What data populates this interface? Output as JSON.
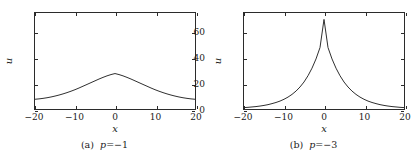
{
  "figure": {
    "background_color": "#ffffff",
    "line_color": "#2b2b2b",
    "axis_color": "#2b2b2b"
  },
  "chart_data": [
    {
      "type": "line",
      "panel_label": "(a)",
      "caption_prefix": "(a)",
      "caption_variable": "p",
      "caption_relation": "=",
      "caption_value": "−1",
      "caption_full": "(a) p = −1",
      "title": "",
      "xlabel": "x",
      "ylabel": "u",
      "xlim": [
        -20,
        20
      ],
      "ylim": [
        0,
        75
      ],
      "xticks": [
        -20,
        -10,
        0,
        10,
        20
      ],
      "xticklabels": [
        "−20",
        "−10",
        "0",
        "10",
        "20"
      ],
      "yticks": [
        0,
        20,
        40,
        60
      ],
      "yticklabels": [
        "0",
        "20",
        "40",
        "60"
      ],
      "grid": false,
      "legend": null,
      "peak_value": 28,
      "edge_value": 7.6,
      "x": [
        -20,
        -19,
        -18,
        -17,
        -16,
        -15,
        -14,
        -13,
        -12,
        -11,
        -10,
        -9,
        -8,
        -7,
        -6,
        -5,
        -4,
        -3,
        -2,
        -1,
        0,
        1,
        2,
        3,
        4,
        5,
        6,
        7,
        8,
        9,
        10,
        11,
        12,
        13,
        14,
        15,
        16,
        17,
        18,
        19,
        20
      ],
      "values": [
        7.6,
        7.9,
        8.3,
        8.8,
        9.4,
        10.1,
        10.9,
        11.8,
        12.8,
        13.9,
        15.1,
        16.4,
        17.8,
        19.2,
        20.6,
        22.0,
        23.4,
        24.7,
        25.9,
        26.9,
        27.7,
        26.9,
        25.9,
        24.7,
        23.4,
        22.0,
        20.6,
        19.2,
        17.8,
        16.4,
        15.1,
        13.9,
        12.8,
        11.8,
        10.9,
        10.1,
        9.4,
        8.8,
        8.3,
        7.9,
        7.6
      ]
    },
    {
      "type": "line",
      "panel_label": "(b)",
      "caption_prefix": "(b)",
      "caption_variable": "p",
      "caption_relation": "=",
      "caption_value": "−3",
      "caption_full": "(b) p = −3",
      "title": "",
      "xlabel": "x",
      "ylabel": "u",
      "xlim": [
        -20,
        20
      ],
      "ylim": [
        0,
        75
      ],
      "xticks": [
        -20,
        -10,
        0,
        10,
        20
      ],
      "xticklabels": [
        "−20",
        "−10",
        "0",
        "10",
        "20"
      ],
      "yticks": [
        0,
        20,
        40,
        60
      ],
      "yticklabels": [
        "0",
        "20",
        "40",
        "60"
      ],
      "grid": false,
      "legend": null,
      "peak_value": 70,
      "edge_value": 1.1,
      "x": [
        -20,
        -19,
        -18,
        -17,
        -16,
        -15,
        -14,
        -13,
        -12,
        -11,
        -10,
        -9,
        -8,
        -7,
        -6,
        -5,
        -4,
        -3,
        -2,
        -1,
        0,
        1,
        2,
        3,
        4,
        5,
        6,
        7,
        8,
        9,
        10,
        11,
        12,
        13,
        14,
        15,
        16,
        17,
        18,
        19,
        20
      ],
      "values": [
        1.1,
        1.3,
        1.6,
        1.9,
        2.3,
        2.8,
        3.4,
        4.2,
        5.1,
        6.2,
        7.6,
        9.3,
        11.4,
        14.0,
        17.2,
        21.1,
        26.0,
        31.9,
        39.1,
        48.0,
        70.0,
        48.0,
        39.1,
        31.9,
        26.0,
        21.1,
        17.2,
        14.0,
        11.4,
        9.3,
        7.6,
        6.2,
        5.1,
        4.2,
        3.4,
        2.8,
        2.3,
        1.9,
        1.6,
        1.3,
        1.1
      ]
    }
  ]
}
